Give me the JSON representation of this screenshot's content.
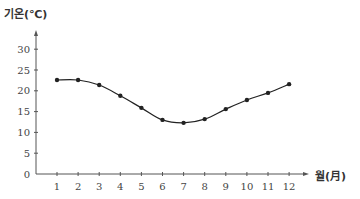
{
  "chart_data": {
    "type": "line",
    "title": "",
    "xlabel": "월(月)",
    "ylabel": "기온(℃)",
    "categories": [
      "1",
      "2",
      "3",
      "4",
      "5",
      "6",
      "7",
      "8",
      "9",
      "10",
      "11",
      "12"
    ],
    "series": [
      {
        "name": "기온",
        "values": [
          22.6,
          22.6,
          21.4,
          18.8,
          15.9,
          13.0,
          12.3,
          13.2,
          15.6,
          17.8,
          19.5,
          21.6
        ]
      }
    ],
    "y_ticks": [
      0,
      5,
      10,
      15,
      20,
      25,
      30
    ],
    "ylim": [
      0,
      34
    ],
    "grid": false,
    "legend": "none",
    "colors": {
      "line": "#222222",
      "axis": "#555555"
    }
  }
}
